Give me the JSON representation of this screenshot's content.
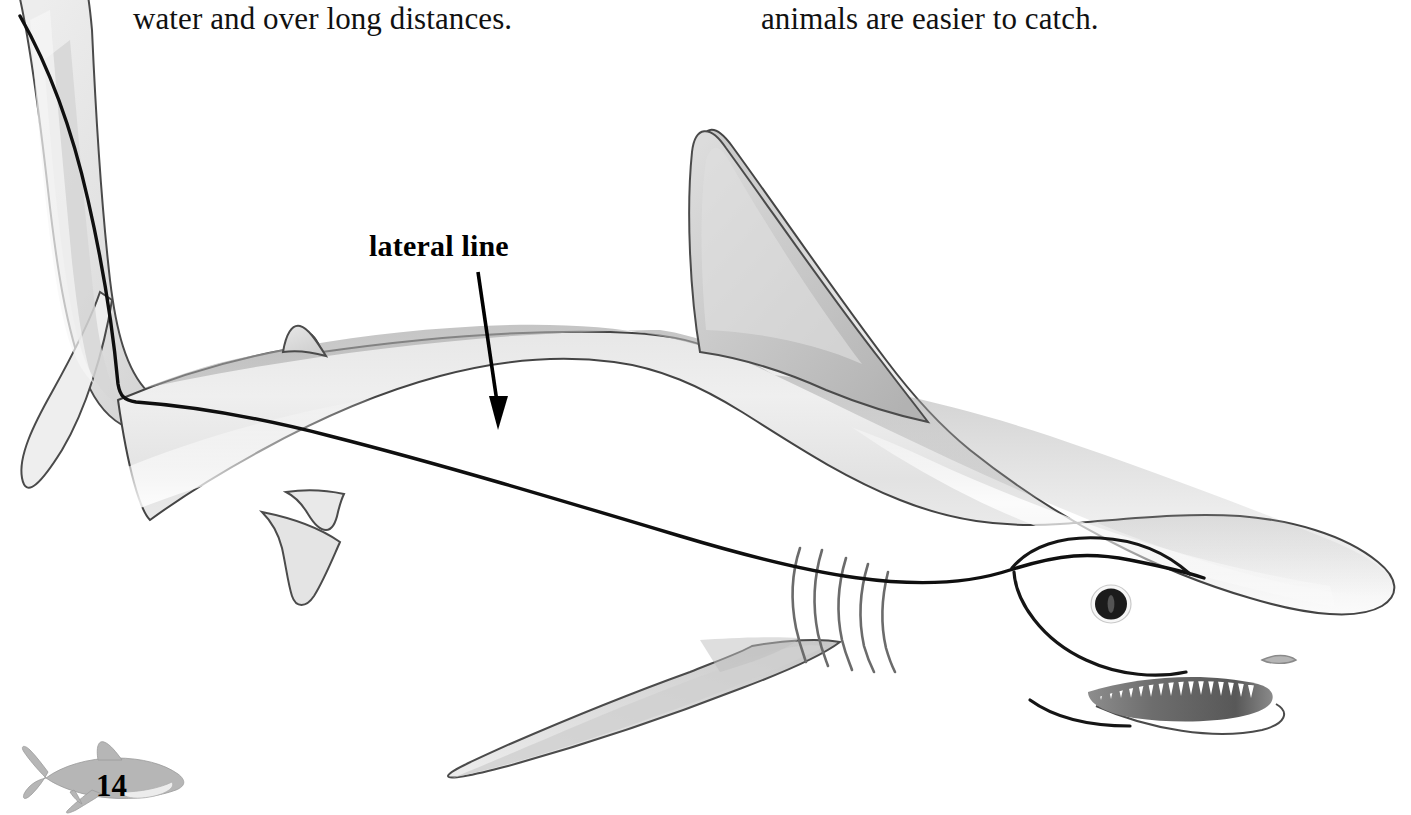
{
  "page": {
    "number": "14",
    "background_color": "#ffffff",
    "text_color": "#111111"
  },
  "body_text": {
    "left_column": "water and over long distances.",
    "right_column": "animals are easier to catch."
  },
  "callout": {
    "label": "lateral line",
    "arrow": "down-arrow",
    "target": "lateral-line-on-shark-body"
  },
  "figure": {
    "view": "side profile facing right",
    "parts": [
      "caudal-fin",
      "second-dorsal-fin",
      "first-dorsal-fin",
      "pectoral-fin",
      "pelvic-fin",
      "anal-fin",
      "gill-slits",
      "eye",
      "mouth-with-teeth",
      "nostril",
      "lateral-line"
    ],
    "gill_slit_count": 5,
    "colors": {
      "outline": "#3c3c3c",
      "body_light": "#f1f1f1",
      "body_mid": "#d9d9d9",
      "body_dark": "#b9b9b9",
      "belly": "#fafafa",
      "lateral_line": "#101010",
      "eye_pupil": "#1a1a1a",
      "eye_ring": "#ffffff",
      "tooth": "#ffffff",
      "mouth_shadow": "#6f6f6f"
    }
  },
  "footer_decoration": {
    "name": "small-shark-decoration",
    "color": "#b3b3b3"
  }
}
